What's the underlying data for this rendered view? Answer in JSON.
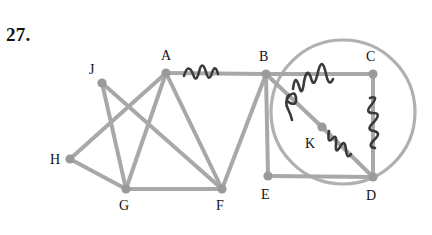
{
  "figure": {
    "problem_number": "27.",
    "colors": {
      "edge": "#a8a8a8",
      "vertex": "#9a9a9a",
      "circle": "#b0b0b0",
      "label": "#111111",
      "scribble": "#3a3a3a",
      "background": "#ffffff"
    },
    "vertices": [
      {
        "id": "J",
        "label": "J",
        "cx": 102,
        "cy": 83,
        "label_x": 89,
        "label_y": 74
      },
      {
        "id": "A",
        "label": "A",
        "cx": 166,
        "cy": 73,
        "label_x": 161,
        "label_y": 60
      },
      {
        "id": "B",
        "label": "B",
        "cx": 266,
        "cy": 74,
        "label_x": 259,
        "label_y": 61
      },
      {
        "id": "C",
        "label": "C",
        "cx": 373,
        "cy": 74,
        "label_x": 366,
        "label_y": 61
      },
      {
        "id": "H",
        "label": "H",
        "cx": 70,
        "cy": 159,
        "label_x": 50,
        "label_y": 164
      },
      {
        "id": "K",
        "label": "K",
        "cx": 322,
        "cy": 127,
        "label_x": 305,
        "label_y": 148
      },
      {
        "id": "G",
        "label": "G",
        "cx": 126,
        "cy": 189,
        "label_x": 119,
        "label_y": 210
      },
      {
        "id": "F",
        "label": "F",
        "cx": 222,
        "cy": 189,
        "label_x": 216,
        "label_y": 210
      },
      {
        "id": "E",
        "label": "E",
        "cx": 268,
        "cy": 176,
        "label_x": 261,
        "label_y": 199
      },
      {
        "id": "D",
        "label": "D",
        "cx": 373,
        "cy": 177,
        "label_x": 366,
        "label_y": 200
      }
    ],
    "edges": [
      {
        "from": "J",
        "to": "G"
      },
      {
        "from": "J",
        "to": "F"
      },
      {
        "from": "A",
        "to": "H"
      },
      {
        "from": "A",
        "to": "G"
      },
      {
        "from": "A",
        "to": "F"
      },
      {
        "from": "A",
        "to": "B"
      },
      {
        "from": "H",
        "to": "G"
      },
      {
        "from": "G",
        "to": "F"
      },
      {
        "from": "B",
        "to": "F"
      },
      {
        "from": "B",
        "to": "E"
      },
      {
        "from": "B",
        "to": "C"
      },
      {
        "from": "B",
        "to": "K"
      },
      {
        "from": "K",
        "to": "D"
      },
      {
        "from": "C",
        "to": "D"
      },
      {
        "from": "E",
        "to": "D"
      }
    ],
    "circle": {
      "cx": 343,
      "cy": 112,
      "r": 72
    },
    "scribbles": [
      {
        "name": "scribble-on-edge-ab",
        "path": "M 184 76 q 4 -14 9 -2 q 3 10 6 -2 q 3 -13 7 0 q 3 11 6 1 q 3 -10 6 1"
      },
      {
        "name": "scribble-on-edge-bc",
        "path": "M 293 89 q 2 -16 6 -3 q 3 12 5 -4 q 3 -16 7 -4 q 3 12 7 -6 q 4 -17 8 2 q 3 14 7 5"
      },
      {
        "name": "scribble-on-edge-bk",
        "path": "M 289 95 q -5 5 1 8 q 7 3 6 -5 q -1 -8 -7 -2 q -5 6 -1 13 q 3 6 4 11"
      },
      {
        "name": "scribble-on-edge-kd",
        "path": "M 329 131 q -2 13 3 8 q 5 -6 4 5 q -1 11 4 3 q 5 -9 6 3 q 1 10 5 4"
      },
      {
        "name": "scribble-on-edge-cd",
        "path": "M 370 98 q 9 -3 2 6 q -8 9 1 9 q 9 0 1 9 q -9 8 0 9 q 8 2 0 9 q -7 7 1 8"
      }
    ]
  }
}
